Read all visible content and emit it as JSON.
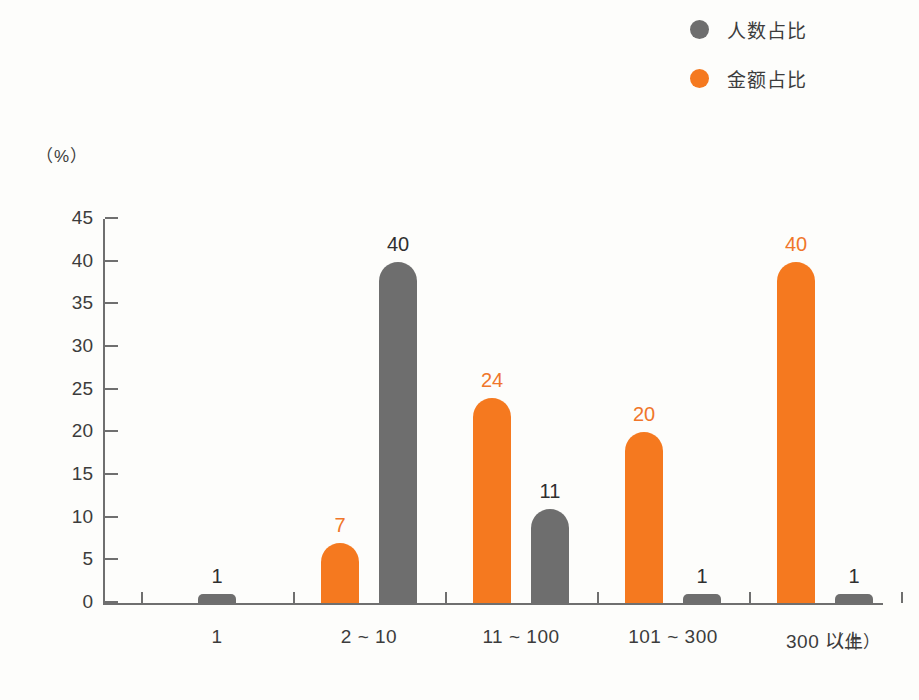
{
  "chart_data": {
    "type": "bar",
    "title": "",
    "subtitle": "",
    "xlabel": "(件)",
    "ylabel": "(%)",
    "ylim": [
      0,
      45
    ],
    "yticks": [
      0,
      5,
      10,
      15,
      20,
      25,
      30,
      35,
      40,
      45
    ],
    "grid": false,
    "legend_position": "top-right",
    "categories": [
      "1",
      "2 ~ 10",
      "11 ~ 100",
      "101 ~ 300",
      "300 以上"
    ],
    "series": [
      {
        "name": "金额占比",
        "color": "#f5791f",
        "values": [
          null,
          7,
          24,
          20,
          40
        ],
        "labels": [
          "",
          "7",
          "24",
          "20",
          "40"
        ]
      },
      {
        "name": "人数占比",
        "color": "#6e6e6e",
        "values": [
          1,
          40,
          11,
          1,
          1
        ],
        "labels": [
          "1",
          "40",
          "11",
          "1",
          "1"
        ]
      }
    ]
  },
  "legend": {
    "items": [
      {
        "label": "人数占比",
        "color": "#6e6e6e",
        "swatch": "circle-marker-gray"
      },
      {
        "label": "金额占比",
        "color": "#f5791f",
        "swatch": "circle-marker-orange"
      }
    ]
  },
  "axes": {
    "y_unit": "（%）",
    "x_unit": "（件）",
    "y_tick_labels": [
      "45",
      "40",
      "35",
      "30",
      "25",
      "20",
      "15",
      "10",
      "5",
      "0"
    ],
    "x_tick_labels": [
      "1",
      "2 ~ 10",
      "11 ~ 100",
      "101 ~ 300",
      "300 以上"
    ]
  },
  "bars": [
    {
      "group": 0,
      "series": "人数占比",
      "value": 1,
      "label": "1",
      "kind": "gray"
    },
    {
      "group": 1,
      "series": "金额占比",
      "value": 7,
      "label": "7",
      "kind": "orange"
    },
    {
      "group": 1,
      "series": "人数占比",
      "value": 40,
      "label": "40",
      "kind": "gray"
    },
    {
      "group": 2,
      "series": "金额占比",
      "value": 24,
      "label": "24",
      "kind": "orange"
    },
    {
      "group": 2,
      "series": "人数占比",
      "value": 11,
      "label": "11",
      "kind": "gray"
    },
    {
      "group": 3,
      "series": "金额占比",
      "value": 20,
      "label": "20",
      "kind": "orange"
    },
    {
      "group": 3,
      "series": "人数占比",
      "value": 1,
      "label": "1",
      "kind": "gray"
    },
    {
      "group": 4,
      "series": "金额占比",
      "value": 40,
      "label": "40",
      "kind": "orange"
    },
    {
      "group": 4,
      "series": "人数占比",
      "value": 1,
      "label": "1",
      "kind": "gray"
    }
  ]
}
